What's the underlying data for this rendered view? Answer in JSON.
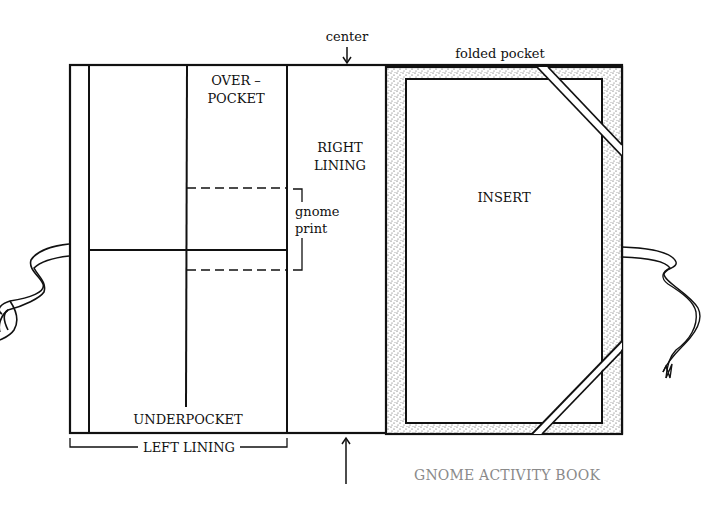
{
  "diagram": {
    "labels": {
      "center": "center",
      "folded_pocket": "folded pocket",
      "overpocket_line1": "OVER –",
      "overpocket_line2": "POCKET",
      "right_lining_line1": "RIGHT",
      "right_lining_line2": "LINING",
      "gnome_print_line1": "gnome",
      "gnome_print_line2": "print",
      "insert": "INSERT",
      "underpocket": "UNDERPOCKET",
      "left_lining": "LEFT LINING"
    },
    "caption": "GNOME ACTIVITY BOOK",
    "colors": {
      "line": "#111111",
      "stipple": "#c9c9c9",
      "caption": "#8a8a8a"
    }
  }
}
